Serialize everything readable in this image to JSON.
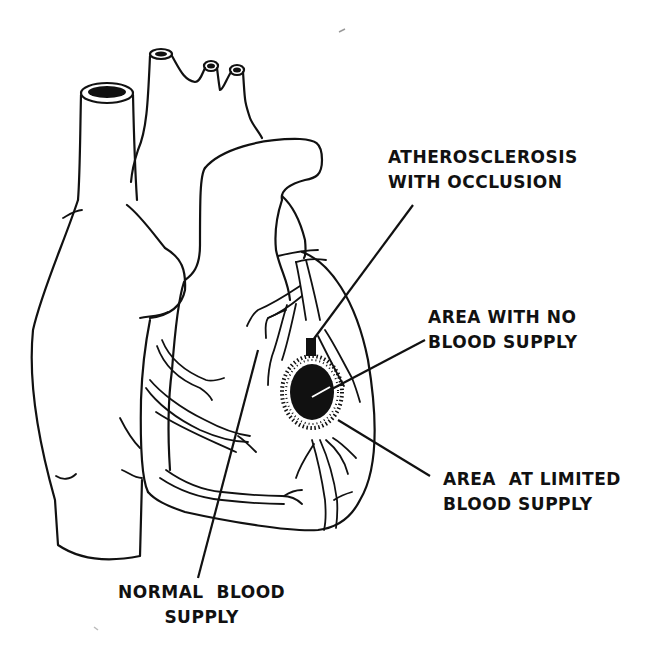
{
  "diagram": {
    "colors": {
      "background": "#ffffff",
      "ink": "#111111"
    },
    "labels": {
      "atherosclerosis": {
        "line1": "ATHEROSCLEROSIS",
        "line2": "WITH OCCLUSION"
      },
      "no_supply": {
        "line1": "AREA WITH NO",
        "line2": "BLOOD SUPPLY"
      },
      "limited_supply": {
        "line1": "AREA  AT LIMITED",
        "line2": "BLOOD SUPPLY"
      },
      "normal_supply": {
        "line1": "NORMAL  BLOOD",
        "line2": "SUPPLY"
      }
    }
  }
}
